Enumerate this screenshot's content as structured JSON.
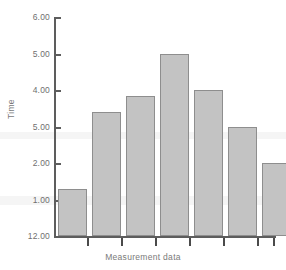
{
  "chart_data": {
    "type": "bar",
    "title": "",
    "xlabel": "Measurement data",
    "ylabel": "Time",
    "categories": [
      "1",
      "2",
      "3",
      "4",
      "5",
      "6",
      "7"
    ],
    "values": [
      1.3,
      3.4,
      3.85,
      5.0,
      4.0,
      3.0,
      2.0
    ],
    "ylim": [
      0,
      6
    ],
    "ytick_values": [
      6,
      5,
      4,
      3,
      2,
      1,
      0
    ],
    "ytick_labels": [
      "6.00",
      "5.00",
      "4.00",
      "5.00",
      "2.00",
      "1.00",
      "12.00"
    ],
    "grid": false,
    "legend": null,
    "bar_fill_color": "#c3c3c3",
    "bar_border_color": "#8e8e8e",
    "axis_color": "#5d5d5d",
    "text_color": "#6f6f6f"
  },
  "axes": {
    "y_title": "Time",
    "x_title": "Measurement data"
  }
}
